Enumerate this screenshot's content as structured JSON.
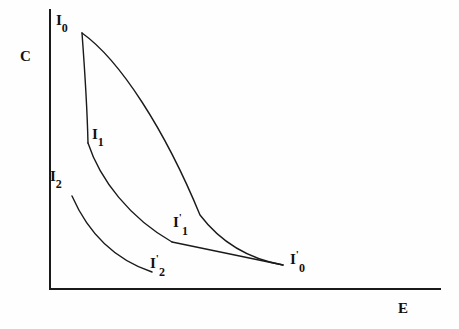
{
  "figure": {
    "title": "",
    "axes": {
      "x_label": "E",
      "y_label": "C",
      "x_label_pos": {
        "x": 398,
        "y": 300
      },
      "y_label_pos": {
        "x": 20,
        "y": 48
      },
      "origin": {
        "x": 50,
        "y": 289
      },
      "x_end": {
        "x": 440,
        "y": 289
      },
      "y_top": {
        "x": 50,
        "y": 10
      },
      "line_color": "#1a1a1a",
      "line_width": 2
    },
    "curve_color": "#1a1a1a",
    "curve_width": 1.4,
    "background_color": "#fefefe"
  },
  "labels": [
    {
      "id": "I0",
      "base": "I",
      "prime": "",
      "sub": "0",
      "x": 56,
      "y": 12,
      "name": "label-I0"
    },
    {
      "id": "I1",
      "base": "I",
      "prime": "",
      "sub": "1",
      "x": 92,
      "y": 126,
      "name": "label-I1"
    },
    {
      "id": "I2",
      "base": "I",
      "prime": "",
      "sub": "2",
      "x": 50,
      "y": 168,
      "name": "label-I2"
    },
    {
      "id": "I1p",
      "base": "I",
      "prime": "'",
      "sub": "1",
      "x": 173,
      "y": 212,
      "name": "label-I1-prime"
    },
    {
      "id": "I2p",
      "base": "I",
      "prime": "'",
      "sub": "2",
      "x": 150,
      "y": 253,
      "name": "label-I2-prime"
    },
    {
      "id": "I0p",
      "base": "I",
      "prime": "'",
      "sub": "0",
      "x": 290,
      "y": 249,
      "name": "label-I0-prime"
    }
  ],
  "chart_data": {
    "type": "line",
    "title": "",
    "xlabel": "E",
    "ylabel": "C",
    "grid": false,
    "legend": false,
    "series": [
      {
        "name": "I0-I'0",
        "start_label": "I0",
        "end_label": "I0'",
        "path": "M 82 33 C 120 60, 165 130, 200 215 C 225 248, 255 260, 283 265",
        "points": [
          [
            82,
            33
          ],
          [
            120,
            80
          ],
          [
            152,
            140
          ],
          [
            180,
            185
          ],
          [
            210,
            225
          ],
          [
            245,
            250
          ],
          [
            283,
            265
          ]
        ]
      },
      {
        "name": "I0-I1",
        "start_label": "I0",
        "end_label": "I1",
        "path": "M 82 33 C 84 60, 87 100, 88 143",
        "points": [
          [
            82,
            33
          ],
          [
            85,
            75
          ],
          [
            87,
            110
          ],
          [
            88,
            143
          ]
        ]
      },
      {
        "name": "I1-I1'",
        "start_label": "I1",
        "end_label": "I1'",
        "path": "M 88 143 C 100 180, 130 218, 172 242",
        "points": [
          [
            88,
            143
          ],
          [
            105,
            185
          ],
          [
            135,
            220
          ],
          [
            172,
            242
          ]
        ]
      },
      {
        "name": "I1'-I0'",
        "start_label": "I1'",
        "end_label": "I0'",
        "path": "M 172 242 L 283 265",
        "points": [
          [
            172,
            242
          ],
          [
            283,
            265
          ]
        ]
      },
      {
        "name": "I2-I2'",
        "start_label": "I2",
        "end_label": "I2'",
        "path": "M 72 196 C 86 228, 110 258, 152 272",
        "points": [
          [
            72,
            196
          ],
          [
            90,
            232
          ],
          [
            118,
            258
          ],
          [
            152,
            272
          ]
        ]
      }
    ]
  }
}
